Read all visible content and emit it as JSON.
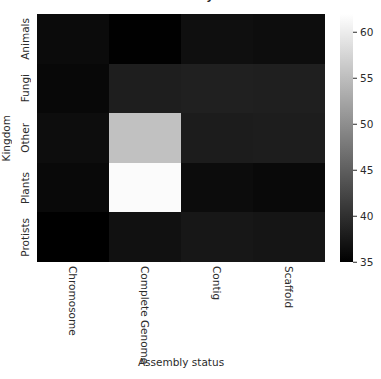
{
  "chart_data": {
    "type": "heatmap",
    "title": "in each assembly status",
    "title_clipped": true,
    "xlabel": "Assembly status",
    "ylabel": "Kingdom",
    "categories_x": [
      "Chromosome",
      "Complete Genome",
      "Contig",
      "Scaffold"
    ],
    "categories_y": [
      "Animals",
      "Fungi",
      "Other",
      "Plants",
      "Protists"
    ],
    "colormap": "gray",
    "colorbar": {
      "vmin": 35,
      "vmax": 62,
      "ticks": [
        35,
        40,
        45,
        50,
        55,
        60
      ],
      "position": "right"
    },
    "grid": false,
    "values": [
      [
        36.2,
        35.1,
        36.6,
        36.4
      ],
      [
        35.9,
        38.2,
        38.4,
        38.3
      ],
      [
        36.4,
        55.4,
        38.0,
        38.1
      ],
      [
        36.0,
        61.6,
        36.3,
        36.0
      ],
      [
        35.0,
        36.8,
        37.4,
        37.2
      ]
    ],
    "rows": [
      {
        "label": "Animals",
        "cells": [
          {
            "x": "Chromosome",
            "value": 36.2
          },
          {
            "x": "Complete Genome",
            "value": 35.1
          },
          {
            "x": "Contig",
            "value": 36.6
          },
          {
            "x": "Scaffold",
            "value": 36.4
          }
        ]
      },
      {
        "label": "Fungi",
        "cells": [
          {
            "x": "Chromosome",
            "value": 35.9
          },
          {
            "x": "Complete Genome",
            "value": 38.2
          },
          {
            "x": "Contig",
            "value": 38.4
          },
          {
            "x": "Scaffold",
            "value": 38.3
          }
        ]
      },
      {
        "label": "Other",
        "cells": [
          {
            "x": "Chromosome",
            "value": 36.4
          },
          {
            "x": "Complete Genome",
            "value": 55.4
          },
          {
            "x": "Contig",
            "value": 38.0
          },
          {
            "x": "Scaffold",
            "value": 38.1
          }
        ]
      },
      {
        "label": "Plants",
        "cells": [
          {
            "x": "Chromosome",
            "value": 36.0
          },
          {
            "x": "Complete Genome",
            "value": 61.6
          },
          {
            "x": "Contig",
            "value": 36.3
          },
          {
            "x": "Scaffold",
            "value": 36.0
          }
        ]
      },
      {
        "label": "Protists",
        "cells": [
          {
            "x": "Chromosome",
            "value": 35.0
          },
          {
            "x": "Complete Genome",
            "value": 36.8
          },
          {
            "x": "Contig",
            "value": 37.4
          },
          {
            "x": "Scaffold",
            "value": 37.2
          }
        ]
      }
    ]
  },
  "colors": {
    "background": "#ffffff",
    "text": "#2b2b2b",
    "colorbar_low": "#000000",
    "colorbar_high": "#ffffff"
  }
}
